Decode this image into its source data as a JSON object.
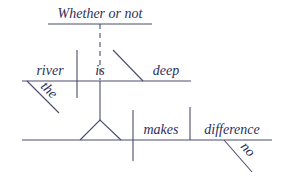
{
  "diagram": {
    "type": "sentence-diagram",
    "sentence": "Whether or not the river is deep makes no difference",
    "colors": {
      "line": "#4a4d6e",
      "text": "#2b2f5a",
      "background": "#ffffff"
    },
    "words": {
      "conjunction": "Whether or not",
      "subject": "river",
      "verb": "is",
      "predicate_adjective": "deep",
      "article": "the",
      "main_verb": "makes",
      "object": "difference",
      "modifier": "no"
    }
  }
}
